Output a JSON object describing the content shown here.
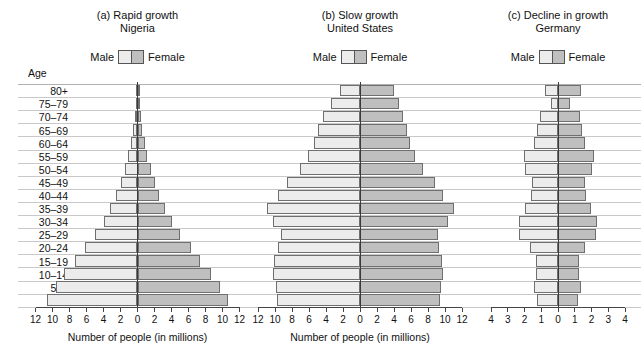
{
  "legend": {
    "male_label": "Male",
    "female_label": "Female"
  },
  "age_header": "Age",
  "age_groups": [
    "80+",
    "75–79",
    "70–74",
    "65–69",
    "60–64",
    "55–59",
    "50–54",
    "45–49",
    "40–44",
    "35–39",
    "30–34",
    "25–29",
    "20–24",
    "15–19",
    "10–14",
    "5–9",
    "0–4"
  ],
  "colors": {
    "male": "#ececec",
    "female": "#bfbfbf",
    "bar_border": "#6f6f6f",
    "gridline": "#c9c9c9",
    "axis": "#444444"
  },
  "panels": [
    {
      "label": "(a) Rapid growth",
      "country": "Nigeria",
      "axis_title": "Number of people (in millions)",
      "ticks": [
        12,
        10,
        8,
        6,
        4,
        2,
        0,
        2,
        4,
        6,
        8,
        10,
        12
      ],
      "max": 12
    },
    {
      "label": "(b) Slow growth",
      "country": "United States",
      "axis_title": "Number of people (in millions)",
      "ticks": [
        12,
        10,
        8,
        6,
        4,
        2,
        0,
        2,
        4,
        6,
        8,
        10,
        12
      ],
      "max": 12
    },
    {
      "label": "(c) Decline in growth",
      "country": "Germany",
      "axis_title": "",
      "ticks": [
        4,
        3,
        2,
        1,
        0,
        1,
        2,
        3,
        4
      ],
      "max": 4
    }
  ],
  "chart_data": {
    "type": "bar",
    "chart_kind": "population-pyramid",
    "xlabel": "Number of people (in millions)",
    "ylabel": "Age",
    "grid": true,
    "legend_position": "above-each-panel",
    "categories": [
      "80+",
      "75–79",
      "70–74",
      "65–69",
      "60–64",
      "55–59",
      "50–54",
      "45–49",
      "40–44",
      "35–39",
      "30–34",
      "25–29",
      "20–24",
      "15–19",
      "10–14",
      "5–9",
      "0–4"
    ],
    "panels": [
      {
        "name": "Nigeria",
        "label": "(a) Rapid growth",
        "xlim": [
          -12,
          12
        ],
        "xticks": [
          12,
          10,
          8,
          6,
          4,
          2,
          0,
          2,
          4,
          6,
          8,
          10,
          12
        ],
        "series": [
          {
            "name": "Male",
            "values": [
              0.12,
              0.22,
              0.35,
              0.55,
              0.8,
              1.1,
              1.5,
              1.95,
              2.5,
              3.2,
              4.0,
              5.0,
              6.2,
              7.3,
              8.6,
              9.6,
              10.6
            ]
          },
          {
            "name": "Female",
            "values": [
              0.14,
              0.24,
              0.38,
              0.58,
              0.85,
              1.15,
              1.55,
              2.0,
              2.55,
              3.25,
              4.05,
              5.05,
              6.25,
              7.35,
              8.65,
              9.65,
              10.6
            ]
          }
        ]
      },
      {
        "name": "United States",
        "label": "(b) Slow growth",
        "xlim": [
          -12,
          12
        ],
        "xticks": [
          12,
          10,
          8,
          6,
          4,
          2,
          0,
          2,
          4,
          6,
          8,
          10,
          12
        ],
        "series": [
          {
            "name": "Male",
            "values": [
              2.4,
              3.4,
              4.3,
              4.9,
              5.4,
              6.1,
              7.1,
              8.6,
              9.6,
              10.9,
              10.2,
              9.3,
              9.6,
              10.1,
              10.2,
              9.9,
              9.8
            ]
          },
          {
            "name": "Female",
            "values": [
              4.0,
              4.6,
              5.0,
              5.5,
              5.9,
              6.5,
              7.4,
              8.8,
              9.8,
              11.1,
              10.3,
              9.2,
              9.3,
              9.7,
              9.8,
              9.5,
              9.4
            ]
          }
        ]
      },
      {
        "name": "Germany",
        "label": "(c) Decline in growth",
        "xlim": [
          -4,
          4
        ],
        "xticks": [
          4,
          3,
          2,
          1,
          0,
          1,
          2,
          3,
          4
        ],
        "series": [
          {
            "name": "Male",
            "values": [
              0.75,
              0.42,
              1.05,
              1.25,
              1.45,
              2.05,
              2.0,
              1.55,
              1.6,
              1.95,
              2.35,
              2.3,
              1.65,
              1.3,
              1.3,
              1.45,
              1.25
            ]
          },
          {
            "name": "Female",
            "values": [
              1.35,
              0.72,
              1.3,
              1.45,
              1.6,
              2.15,
              2.05,
              1.6,
              1.65,
              1.95,
              2.3,
              2.25,
              1.6,
              1.25,
              1.25,
              1.4,
              1.2
            ]
          }
        ]
      }
    ]
  }
}
